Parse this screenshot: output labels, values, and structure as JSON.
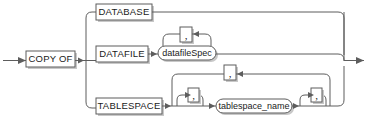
{
  "diagram": {
    "type": "railroad-syntax-diagram",
    "title": "COPY OF",
    "entry_arrow": "right-arrow",
    "exit_arrow": "right-arrow",
    "nodes": {
      "copy_of": {
        "label": "COPY OF",
        "shape": "rect"
      },
      "database": {
        "label": "DATABASE",
        "shape": "rect"
      },
      "datafile": {
        "label": "DATAFILE",
        "shape": "rect"
      },
      "tablespace": {
        "label": "TABLESPACE",
        "shape": "rect"
      },
      "datafile_spec": {
        "label": "datafileSpec",
        "shape": "oval"
      },
      "tablespace_name": {
        "label": "tablespace_name",
        "shape": "oval"
      }
    },
    "separators": {
      "datafile_loop": {
        "label": ",",
        "shape": "rect",
        "direction": "left"
      },
      "tablespace_outer_loop": {
        "label": ",",
        "shape": "rect",
        "direction": "left"
      },
      "tablespace_left_loop": {
        "label": ",",
        "shape": "rect",
        "direction": "left"
      },
      "tablespace_right_loop": {
        "label": ",",
        "shape": "rect",
        "direction": "left"
      }
    },
    "branches": [
      "DATABASE",
      "DATAFILE datafileSpec [, ...]",
      "TABLESPACE [, ...] tablespace_name [, ...]"
    ],
    "colors": {
      "line": "#5d5d5d",
      "shadow": "#c8c8c8",
      "text": "#1a1a1a",
      "background": "#ffffff"
    }
  }
}
